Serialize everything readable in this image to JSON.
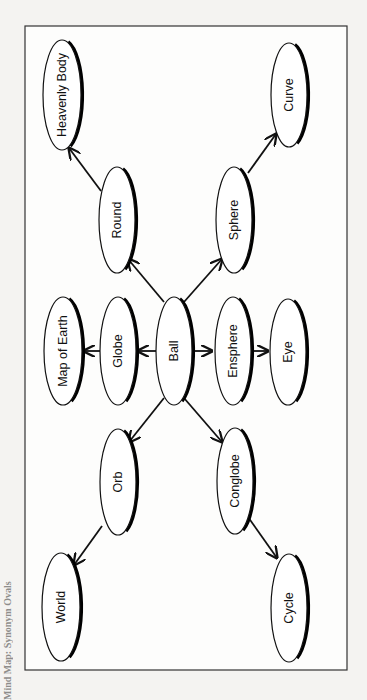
{
  "caption": "Mind Map: Synonym Ovals",
  "diagram": {
    "type": "mind-map",
    "orientation": "rotated-90",
    "colors": {
      "stroke": "#111111",
      "fill": "#ffffff",
      "background": "#f4f3f1"
    },
    "central_node": "Ball",
    "nodes": [
      {
        "id": "heavenly-body",
        "label": "Heavenly Body",
        "cx": 62,
        "cy": 95,
        "rx": 19,
        "ry": 55
      },
      {
        "id": "curve",
        "label": "Curve",
        "cx": 289,
        "cy": 95,
        "rx": 18,
        "ry": 52
      },
      {
        "id": "round",
        "label": "Round",
        "cx": 117,
        "cy": 220,
        "rx": 18,
        "ry": 53
      },
      {
        "id": "sphere",
        "label": "Sphere",
        "cx": 234,
        "cy": 220,
        "rx": 18,
        "ry": 53
      },
      {
        "id": "map-of-earth",
        "label": "Map of Earth",
        "cx": 63,
        "cy": 351,
        "rx": 19,
        "ry": 54
      },
      {
        "id": "globe",
        "label": "Globe",
        "cx": 118,
        "cy": 351,
        "rx": 18,
        "ry": 54
      },
      {
        "id": "ball",
        "label": "Ball",
        "cx": 174,
        "cy": 351,
        "rx": 18,
        "ry": 54
      },
      {
        "id": "ensphere",
        "label": "Ensphere",
        "cx": 233,
        "cy": 351,
        "rx": 18,
        "ry": 54
      },
      {
        "id": "eye",
        "label": "Eye",
        "cx": 288,
        "cy": 352,
        "rx": 18,
        "ry": 53
      },
      {
        "id": "orb",
        "label": "Orb",
        "cx": 118,
        "cy": 482,
        "rx": 18,
        "ry": 53
      },
      {
        "id": "conglobe",
        "label": "Conglobe",
        "cx": 235,
        "cy": 481,
        "rx": 18,
        "ry": 53
      },
      {
        "id": "world",
        "label": "World",
        "cx": 61,
        "cy": 607,
        "rx": 19,
        "ry": 54
      },
      {
        "id": "cycle",
        "label": "Cycle",
        "cx": 289,
        "cy": 608,
        "rx": 18,
        "ry": 54
      }
    ],
    "edges": [
      {
        "from": "ball",
        "to": "round",
        "x1": 164,
        "y1": 302,
        "x2": 128,
        "y2": 259
      },
      {
        "from": "ball",
        "to": "sphere",
        "x1": 184,
        "y1": 302,
        "x2": 222,
        "y2": 259
      },
      {
        "from": "ball",
        "to": "globe",
        "x1": 156,
        "y1": 351,
        "x2": 138,
        "y2": 351
      },
      {
        "from": "ball",
        "to": "ensphere",
        "x1": 192,
        "y1": 351,
        "x2": 212,
        "y2": 351
      },
      {
        "from": "ball",
        "to": "orb",
        "x1": 164,
        "y1": 398,
        "x2": 129,
        "y2": 442
      },
      {
        "from": "ball",
        "to": "conglobe",
        "x1": 184,
        "y1": 398,
        "x2": 222,
        "y2": 442
      },
      {
        "from": "globe",
        "to": "map-of-earth",
        "x1": 100,
        "y1": 351,
        "x2": 84,
        "y2": 351
      },
      {
        "from": "ensphere",
        "to": "eye",
        "x1": 251,
        "y1": 351,
        "x2": 268,
        "y2": 351
      },
      {
        "from": "round",
        "to": "heavenly-body",
        "x1": 101,
        "y1": 191,
        "x2": 69,
        "y2": 148
      },
      {
        "from": "sphere",
        "to": "curve",
        "x1": 248,
        "y1": 173,
        "x2": 276,
        "y2": 134
      },
      {
        "from": "orb",
        "to": "world",
        "x1": 102,
        "y1": 526,
        "x2": 74,
        "y2": 565
      },
      {
        "from": "conglobe",
        "to": "cycle",
        "x1": 248,
        "y1": 517,
        "x2": 277,
        "y2": 558
      }
    ]
  }
}
